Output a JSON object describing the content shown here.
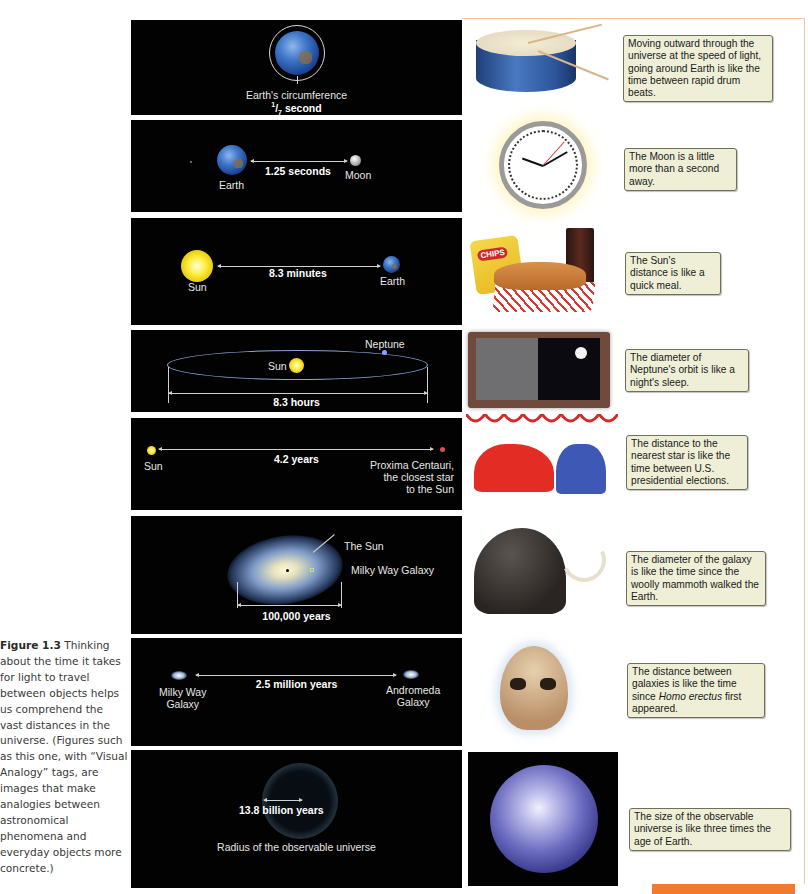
{
  "caption": {
    "figure_label": "Figure 1.3",
    "text": "Thinking about the time it takes for light to travel between objects helps us comprehend the vast distances in the universe. (Figures such as this one, with “Visual Analogy” tags, are images that make analogies between astronomical phenomena and everyday objects more concrete.)"
  },
  "colors": {
    "panel_bg": "#020202",
    "callout_bg": "#eeefd6",
    "frame_accent": "#f07a30"
  },
  "rows": [
    {
      "panel": {
        "label": "Earth's circumference",
        "value_num": "1",
        "value_den": "7",
        "value_unit": "second"
      },
      "illustration": "drum-icon",
      "callout": "Moving outward through the universe at the speed of light, going around Earth is like the time between rapid drum beats."
    },
    {
      "panel": {
        "left_label": "Earth",
        "value": "1.25 seconds",
        "right_label": "Moon"
      },
      "illustration": "clock-icon",
      "callout": "The Moon is a little more than a second away."
    },
    {
      "panel": {
        "left_label": "Sun",
        "value": "8.3 minutes",
        "right_label": "Earth"
      },
      "illustration": "meal-icon",
      "illustration_text": "CHIPS",
      "callout": "The Sun's distance is like a quick meal."
    },
    {
      "panel": {
        "center_label": "Sun",
        "orbit_label": "Neptune",
        "value": "8.3 hours"
      },
      "illustration": "night-window-icon",
      "callout": "The diameter of Neptune's orbit is like a night's sleep."
    },
    {
      "panel": {
        "left_label": "Sun",
        "value": "4.2 years",
        "right_label_lines": [
          "Proxima Centauri,",
          "the closest star",
          "to the Sun"
        ]
      },
      "illustration": "elephant-donkey-icon",
      "callout": "The distance to the nearest star is like the time between U.S. presidential elections."
    },
    {
      "panel": {
        "sun_label": "The Sun",
        "galaxy_label": "Milky Way Galaxy",
        "value": "100,000 years"
      },
      "illustration": "woolly-mammoth-icon",
      "callout": "The diameter of the galaxy is like the time since the woolly mammoth walked the Earth."
    },
    {
      "panel": {
        "left_label_lines": [
          "Milky Way",
          "Galaxy"
        ],
        "value": "2.5 million years",
        "right_label_lines": [
          "Andromeda",
          "Galaxy"
        ]
      },
      "illustration": "skull-icon",
      "callout_pre": "The distance between galaxies is like the time since ",
      "callout_italic": "Homo erectus",
      "callout_post": " first appeared."
    },
    {
      "panel": {
        "value": "13.8 billion years",
        "label": "Radius of the observable universe"
      },
      "illustration": "earth-photo-icon",
      "callout": "The size of the observable universe is like three times the age of Earth."
    }
  ]
}
